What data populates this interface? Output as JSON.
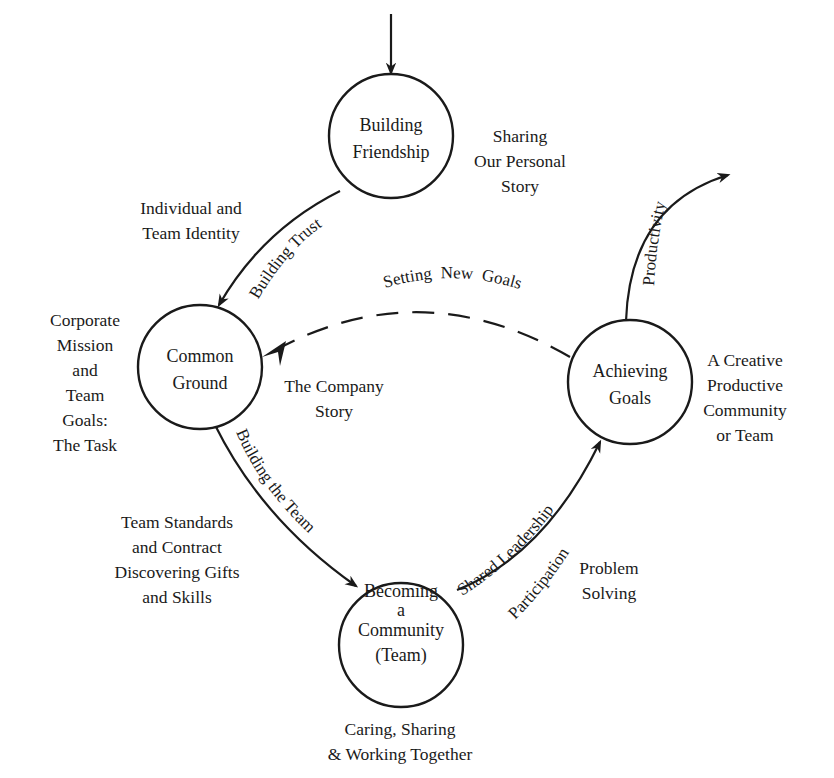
{
  "nodes": {
    "building_friendship": {
      "line1": "Building",
      "line2": "Friendship"
    },
    "common_ground": {
      "line1": "Common",
      "line2": "Ground"
    },
    "achieving_goals": {
      "line1": "Achieving",
      "line2": "Goals"
    },
    "becoming_community": {
      "line1": "Becoming",
      "line2": "a",
      "line3": "Community",
      "line4": "(Team)"
    }
  },
  "edges": {
    "building_trust": "Building Trust",
    "building_the_team": "Building the Team",
    "shared_leadership": "Shared Leadership",
    "participation": "Participation",
    "productivity": "Productivity",
    "setting_new_goals": "Setting  New  Goals"
  },
  "annotations": {
    "sharing_story": [
      "Sharing",
      "Our Personal",
      "Story"
    ],
    "individual_identity": [
      "Individual and",
      "Team Identity"
    ],
    "corporate_mission": [
      "Corporate",
      "Mission",
      "and",
      "Team",
      "Goals:",
      "The Task"
    ],
    "company_story": [
      "The Company",
      "Story"
    ],
    "creative_community": [
      "A Creative",
      "Productive",
      "Community",
      "or Team"
    ],
    "team_standards": [
      "Team Standards",
      "and Contract",
      "Discovering Gifts",
      "and Skills"
    ],
    "problem_solving": [
      "Problem",
      "Solving"
    ],
    "caring_sharing": [
      "Caring, Sharing",
      "& Working Together"
    ]
  }
}
